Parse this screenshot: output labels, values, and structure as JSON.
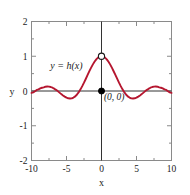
{
  "chart_data": {
    "type": "line",
    "title": "",
    "subtitle": "",
    "xlabel": "x",
    "ylabel": "y",
    "xlim": [
      -10,
      10
    ],
    "ylim": [
      -2,
      2
    ],
    "grid": false,
    "legend": "none",
    "curve_color": "#b5162f",
    "frame_color": "#8a8a8a",
    "axis_color": "#333333",
    "x_ticks": [
      -10,
      -5,
      0,
      5,
      10
    ],
    "x_tick_labels": [
      "-10",
      "-5",
      "0",
      "5",
      "10"
    ],
    "x_minor_ticks": [
      -7.5,
      -2.5,
      2.5,
      7.5
    ],
    "y_ticks": [
      -2,
      -1,
      0,
      1,
      2
    ],
    "y_tick_labels": [
      "-2",
      "-1",
      "0",
      "1",
      "2"
    ],
    "y_minor_ticks": [
      -1.5,
      -0.5,
      0.5,
      1.5
    ],
    "series": [
      {
        "name": "h",
        "expression": "h(x) = sin(x)/x",
        "color": "#b5162f",
        "x": [
          -10,
          -9.75,
          -9.5,
          -9.25,
          -9,
          -8.75,
          -8.5,
          -8.25,
          -8,
          -7.75,
          -7.5,
          -7.25,
          -7,
          -6.75,
          -6.5,
          -6.25,
          -6,
          -5.75,
          -5.5,
          -5.25,
          -5,
          -4.75,
          -4.5,
          -4.25,
          -4,
          -3.75,
          -3.5,
          -3.25,
          -3,
          -2.75,
          -2.5,
          -2.25,
          -2,
          -1.75,
          -1.5,
          -1.25,
          -1,
          -0.75,
          -0.5,
          -0.25,
          0,
          0.25,
          0.5,
          0.75,
          1,
          1.25,
          1.5,
          1.75,
          2,
          2.25,
          2.5,
          2.75,
          3,
          3.25,
          3.5,
          3.75,
          4,
          4.25,
          4.5,
          4.75,
          5,
          5.25,
          5.5,
          5.75,
          6,
          6.25,
          6.5,
          6.75,
          7,
          7.25,
          7.5,
          7.75,
          8,
          8.25,
          8.5,
          8.75,
          9,
          9.25,
          9.5,
          9.75,
          10
        ],
        "y": [
          -0.0544,
          -0.0389,
          -0.0078,
          0.0318,
          0.0458,
          0.0742,
          0.0938,
          0.1042,
          0.1237,
          0.1283,
          0.1254,
          0.1152,
          0.0939,
          0.0661,
          0.0331,
          -0.0029,
          -0.0466,
          -0.0896,
          -0.1276,
          -0.1608,
          -0.1918,
          -0.2099,
          -0.2172,
          -0.2125,
          -0.1892,
          -0.1541,
          -0.1002,
          -0.0338,
          0.047,
          0.14,
          0.2394,
          0.3463,
          0.4546,
          0.562,
          0.665,
          0.7589,
          0.8415,
          0.9089,
          0.9589,
          0.9896,
          1.0,
          0.9896,
          0.9589,
          0.9089,
          0.8415,
          0.7589,
          0.665,
          0.562,
          0.4546,
          0.3463,
          0.2394,
          0.14,
          0.047,
          -0.0338,
          -0.1002,
          -0.1541,
          -0.1892,
          -0.2125,
          -0.2172,
          -0.2099,
          -0.1918,
          -0.1608,
          -0.1276,
          -0.0896,
          -0.0466,
          -0.0029,
          0.0331,
          0.0661,
          0.0939,
          0.1152,
          0.1254,
          0.1283,
          0.1237,
          0.1042,
          0.0938,
          0.0742,
          0.0458,
          0.0318,
          -0.0078,
          -0.0389,
          -0.0544
        ]
      }
    ],
    "annotations": [
      {
        "name": "curve-label",
        "text": "y = h(x)",
        "x": -5.0,
        "y": 0.62
      },
      {
        "name": "origin-point-label",
        "text": "(0, 0)",
        "x": 0.35,
        "y": -0.26
      }
    ],
    "markers": [
      {
        "name": "open-circle-limit",
        "style": "open",
        "x": 0,
        "y": 1,
        "fill": "#ffffff",
        "stroke": "#1a1a1a"
      },
      {
        "name": "filled-dot-origin",
        "style": "filled",
        "x": 0,
        "y": 0,
        "fill": "#000000",
        "stroke": "#000000"
      }
    ]
  }
}
